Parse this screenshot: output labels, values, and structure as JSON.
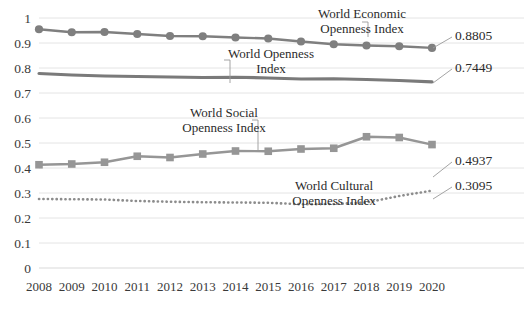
{
  "chart_data": {
    "type": "line",
    "title": "",
    "xlabel": "",
    "ylabel": "",
    "ylim": [
      0,
      1
    ],
    "ytick_values": [
      0,
      0.1,
      0.2,
      0.3,
      0.4,
      0.5,
      0.6,
      0.7,
      0.8,
      0.9,
      1
    ],
    "ytick_labels": [
      "0",
      "0.1",
      "0.2",
      "0.3",
      "0.4",
      "0.5",
      "0.6",
      "0.7",
      "0.8",
      "0.9",
      "1"
    ],
    "grid": true,
    "legend_position": "inline-annotations",
    "categories": [
      "2008",
      "2009",
      "2010",
      "2011",
      "2012",
      "2013",
      "2014",
      "2015",
      "2016",
      "2017",
      "2018",
      "2019",
      "2020"
    ],
    "x": [
      2008,
      2009,
      2010,
      2011,
      2012,
      2013,
      2014,
      2015,
      2016,
      2017,
      2018,
      2019,
      2020
    ],
    "series": [
      {
        "name": "World Economic Openness Index",
        "marker": "circle",
        "linestyle": "solid",
        "color": "#7f7f7f",
        "values": [
          0.955,
          0.943,
          0.944,
          0.936,
          0.928,
          0.927,
          0.922,
          0.918,
          0.906,
          0.895,
          0.89,
          0.887,
          0.8805
        ],
        "end_label": "0.8805"
      },
      {
        "name": "World Openness Index",
        "marker": "none",
        "linestyle": "solid",
        "color": "#7a7a7a",
        "values": [
          0.778,
          0.772,
          0.768,
          0.766,
          0.764,
          0.762,
          0.763,
          0.76,
          0.756,
          0.757,
          0.754,
          0.75,
          0.7449
        ],
        "end_label": "0.7449"
      },
      {
        "name": "World Social Openness Index",
        "marker": "square",
        "linestyle": "solid",
        "color": "#969696",
        "values": [
          0.413,
          0.416,
          0.423,
          0.447,
          0.442,
          0.456,
          0.468,
          0.467,
          0.476,
          0.479,
          0.525,
          0.522,
          0.4937
        ],
        "end_label": "0.4937"
      },
      {
        "name": "World Cultural Openness Index",
        "marker": "none",
        "linestyle": "dotted",
        "color": "#8c8c8c",
        "values": [
          0.276,
          0.275,
          0.274,
          0.268,
          0.265,
          0.263,
          0.262,
          0.261,
          0.255,
          0.256,
          0.262,
          0.288,
          0.3095
        ],
        "end_label": "0.3095"
      }
    ],
    "annotations": [
      {
        "id": "economic",
        "text_line1": "World Economic",
        "text_line2": "Openness Index",
        "points_to_year": 2017
      },
      {
        "id": "openness",
        "text_line1": "World Openness",
        "text_line2": "Index",
        "points_to_year": 2013
      },
      {
        "id": "social",
        "text_line1": "World Social",
        "text_line2": "Openness Index",
        "points_to_year": 2013
      },
      {
        "id": "cultural",
        "text_line1": "World Cultural",
        "text_line2": "Openness Index",
        "points_to_year": 2016
      }
    ]
  }
}
